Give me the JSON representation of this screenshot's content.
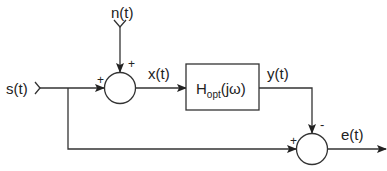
{
  "diagram": {
    "type": "block-diagram",
    "signals": {
      "input": "s(t)",
      "noise": "n(t)",
      "filter_input": "x(t)",
      "filter_output": "y(t)",
      "error": "e(t)"
    },
    "filter": {
      "main": "H",
      "subscript": "opt",
      "argument": "(jω)"
    },
    "junctions": [
      {
        "id": "sum1",
        "signs": {
          "left": "+",
          "top": "+"
        }
      },
      {
        "id": "sum2",
        "signs": {
          "left": "+",
          "top": "-"
        }
      }
    ],
    "colors": {
      "stroke": "#333333",
      "text": "#222222"
    }
  }
}
